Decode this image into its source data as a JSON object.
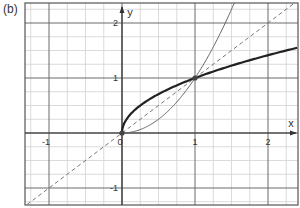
{
  "panel_label": "(b)",
  "chart_data": {
    "type": "line",
    "title": "",
    "xlabel": "x",
    "ylabel": "y",
    "xlim": [
      -1.3,
      2.4
    ],
    "ylim": [
      -1.3,
      2.4
    ],
    "grid": true,
    "grid_minor_step": 0.25,
    "grid_major_step": 1,
    "x_ticks": [
      "-1",
      "0",
      "1",
      "2"
    ],
    "y_ticks": [
      "-1",
      "1",
      "2"
    ],
    "origin_label": "0",
    "series": [
      {
        "name": "y = √x",
        "style": "solid-thick",
        "color": "#222222",
        "x": [
          0,
          0.0625,
          0.25,
          0.5,
          1,
          1.5,
          2,
          2.4
        ],
        "y": [
          0,
          0.25,
          0.5,
          0.707,
          1,
          1.225,
          1.414,
          1.549
        ]
      },
      {
        "name": "y = x²",
        "style": "solid-thin",
        "color": "#666666",
        "x": [
          0,
          0.25,
          0.5,
          0.75,
          1,
          1.25,
          1.5,
          1.55
        ],
        "y": [
          0,
          0.0625,
          0.25,
          0.5625,
          1,
          1.5625,
          2.25,
          2.4
        ]
      },
      {
        "name": "y = x",
        "style": "dashed",
        "color": "#777777",
        "x": [
          -1.3,
          2.4
        ],
        "y": [
          -1.3,
          2.4
        ]
      }
    ],
    "points": [
      {
        "x": 0,
        "y": 0
      },
      {
        "x": 1,
        "y": 1
      }
    ]
  }
}
